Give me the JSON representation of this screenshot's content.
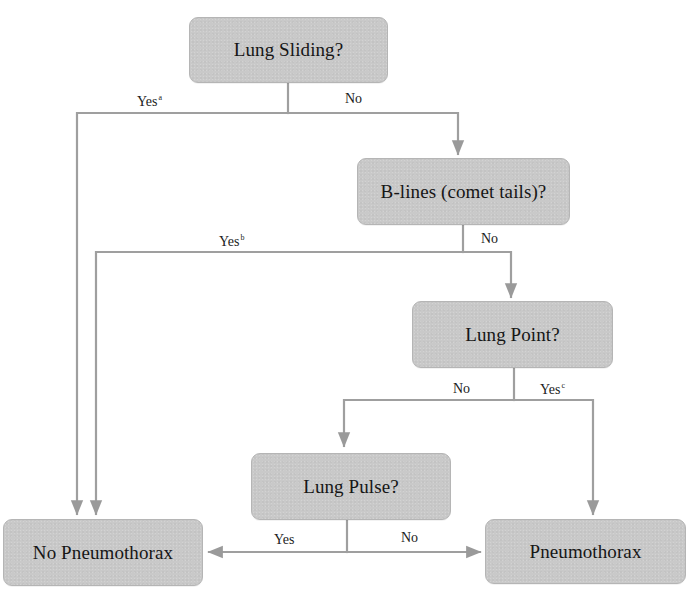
{
  "diagram": {
    "type": "flowchart",
    "line_color": "#9a9a9a",
    "node_fill": "#c9c9c9",
    "nodes": {
      "lung_sliding": {
        "label": "Lung Sliding?"
      },
      "b_lines": {
        "label": "B-lines (comet tails)?"
      },
      "lung_point": {
        "label": "Lung Point?"
      },
      "lung_pulse": {
        "label": "Lung Pulse?"
      },
      "no_pneumothorax": {
        "label": "No Pneumothorax"
      },
      "pneumothorax": {
        "label": "Pneumothorax"
      }
    },
    "edges": {
      "sliding_yes": {
        "label": "Yes",
        "superscript": "a",
        "from": "Lung Sliding?",
        "to": "No Pneumothorax"
      },
      "sliding_no": {
        "label": "No",
        "from": "Lung Sliding?",
        "to": "B-lines (comet tails)?"
      },
      "blines_yes": {
        "label": "Yes",
        "superscript": "b",
        "from": "B-lines (comet tails)?",
        "to": "No Pneumothorax"
      },
      "blines_no": {
        "label": "No",
        "from": "B-lines (comet tails)?",
        "to": "Lung Point?"
      },
      "point_no": {
        "label": "No",
        "from": "Lung Point?",
        "to": "Lung Pulse?"
      },
      "point_yes": {
        "label": "Yes",
        "superscript": "c",
        "from": "Lung Point?",
        "to": "Pneumothorax"
      },
      "pulse_yes": {
        "label": "Yes",
        "from": "Lung Pulse?",
        "to": "No Pneumothorax"
      },
      "pulse_no": {
        "label": "No",
        "from": "Lung Pulse?",
        "to": "Pneumothorax"
      }
    }
  }
}
